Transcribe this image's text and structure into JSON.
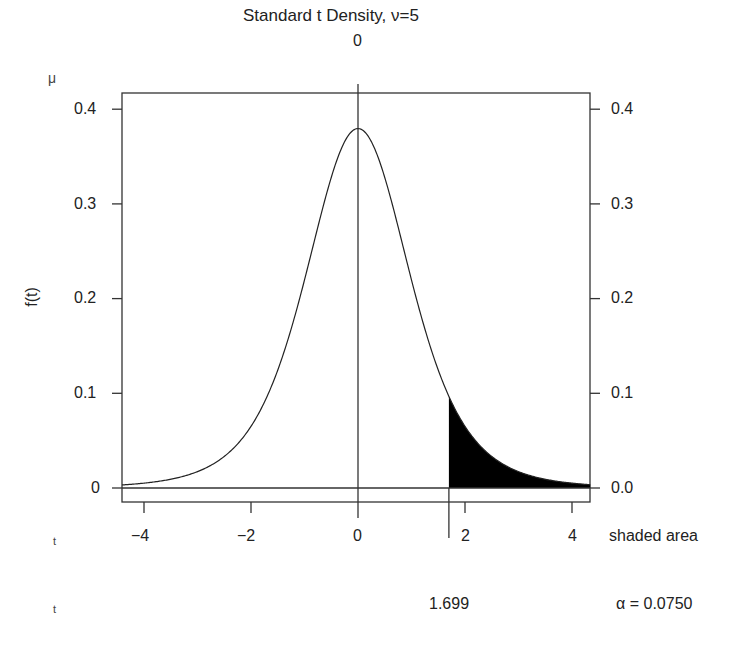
{
  "chart_data": {
    "type": "area",
    "title": "Standard t Density, ν=5",
    "df": 5,
    "xlabel": "t",
    "ylabel": "f(t)",
    "xlim": [
      -4.41,
      4.34
    ],
    "ylim": [
      -0.015,
      0.42
    ],
    "x_ticks": [
      -4,
      -2,
      0,
      2,
      4
    ],
    "x_tick_labels": [
      "−4",
      "−2",
      "0",
      "2",
      "4"
    ],
    "y_ticks_left": [
      0,
      0.1,
      0.2,
      0.3,
      0.4
    ],
    "y_tick_labels_left": [
      "0",
      "0.1",
      "0.2",
      "0.3",
      "0.4"
    ],
    "y_ticks_right": [
      0,
      0.1,
      0.2,
      0.3,
      0.4
    ],
    "y_tick_labels_right": [
      "0.0",
      "0.1",
      "0.2",
      "0.3",
      "0.4"
    ],
    "top_axis_tick": 0,
    "top_axis_label": "0",
    "mu_label": "μ",
    "critical_value": 1.699,
    "shaded_region": "right tail, t > 1.699",
    "shaded_area": 0.075,
    "grid": false,
    "series": [
      {
        "name": "t density (df=5)",
        "x": [
          -4,
          -3,
          -2,
          -1,
          0,
          1,
          1.699,
          2,
          3,
          4
        ],
        "values": [
          0.0051,
          0.0173,
          0.0651,
          0.2197,
          0.3796,
          0.2197,
          0.0939,
          0.0651,
          0.0173,
          0.0051
        ]
      }
    ]
  },
  "labels": {
    "title": "Standard t Density, ν=5",
    "mu": "μ",
    "top_zero": "0",
    "ylabel": "f(t)",
    "y_left": [
      "0.4",
      "0.3",
      "0.2",
      "0.1",
      "0"
    ],
    "y_right": [
      "0.4",
      "0.3",
      "0.2",
      "0.1",
      "0.0"
    ],
    "x_ticks": [
      "−4",
      "−2",
      "0",
      "2",
      "4"
    ],
    "t_row1": "t",
    "t_row2": "t",
    "shaded_area_label": "shaded area",
    "critical_value": "1.699",
    "alpha": "α = 0.0750"
  }
}
